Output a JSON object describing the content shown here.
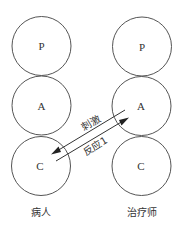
{
  "diagram": {
    "patient": {
      "label": "病人",
      "states": [
        {
          "letter": "P"
        },
        {
          "letter": "A"
        },
        {
          "letter": "C"
        }
      ]
    },
    "therapist": {
      "label": "治疗师",
      "states": [
        {
          "letter": "P"
        },
        {
          "letter": "A"
        },
        {
          "letter": "C"
        }
      ]
    },
    "transactions": [
      {
        "label": "刺激",
        "from": "therapist.A",
        "to": "patient.C"
      },
      {
        "label": "反应1",
        "from": "patient.C",
        "to": "therapist.A"
      }
    ]
  }
}
